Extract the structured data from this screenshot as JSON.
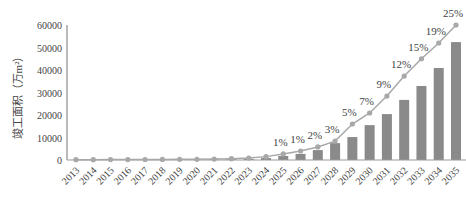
{
  "chart_data": {
    "type": "bar",
    "title": "",
    "xlabel": "",
    "ylabel": "竣工面积（万m²）",
    "ylim": [
      0,
      60000
    ],
    "yticks": [
      0,
      10000,
      20000,
      30000,
      40000,
      50000,
      60000
    ],
    "grid": false,
    "legend": null,
    "categories": [
      "2013",
      "2014",
      "2015",
      "2016",
      "2017",
      "2018",
      "2019",
      "2020",
      "2021",
      "2022",
      "2023",
      "2024",
      "2025",
      "2026",
      "2027",
      "2028",
      "2029",
      "2030",
      "2031",
      "2032",
      "2033",
      "2034",
      "2035"
    ],
    "series": [
      {
        "name": "竣工面积",
        "type": "bar",
        "color": "#8a8a8a",
        "values": [
          80,
          90,
          100,
          110,
          120,
          140,
          160,
          190,
          260,
          330,
          500,
          900,
          1800,
          2700,
          4400,
          7500,
          10200,
          15500,
          20400,
          26700,
          32900,
          40900,
          52400
        ]
      },
      {
        "name": "占比",
        "type": "line",
        "color": "#a8a8a8",
        "values": [
          150,
          160,
          180,
          200,
          220,
          250,
          280,
          320,
          400,
          600,
          900,
          1500,
          2700,
          4000,
          5800,
          8400,
          16000,
          20900,
          28400,
          37300,
          45000,
          52000,
          60000
        ],
        "labels": [
          "",
          "",
          "",
          "",
          "",
          "",
          "",
          "",
          "",
          "",
          "",
          "",
          "1%",
          "1%",
          "2%",
          "3%",
          "5%",
          "7%",
          "9%",
          "12%",
          "15%",
          "19%",
          "25%"
        ]
      }
    ]
  }
}
